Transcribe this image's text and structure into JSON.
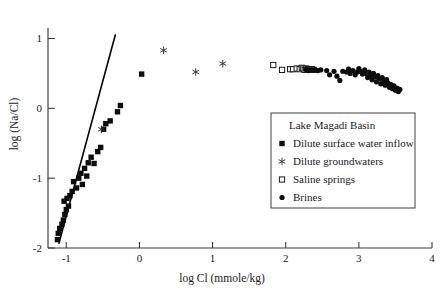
{
  "chart_data": {
    "type": "scatter",
    "title": "",
    "xlabel": "log Cl (mmole/kg)",
    "ylabel": "log (Na/Cl)",
    "xlim": [
      -1.25,
      4.0
    ],
    "ylim": [
      -2.0,
      1.15
    ],
    "xticks": [
      -1,
      0,
      1,
      2,
      3,
      4
    ],
    "xtick_labels": [
      "-1",
      "0",
      "1",
      "2",
      "3",
      "4"
    ],
    "yticks": [
      -2,
      -1,
      0,
      1
    ],
    "ytick_labels": [
      "-2",
      "-1",
      "0",
      "1"
    ],
    "grid": false,
    "legend_position": "center-right",
    "legend_title": "Lake Magadi Basin",
    "trend_line": {
      "name": "dilution trend",
      "x": [
        -1.1,
        -0.33
      ],
      "y": [
        -1.93,
        1.05
      ]
    },
    "series": [
      {
        "name": "Dilute surface water inflow",
        "marker": "filled-square",
        "color": "#0d0d0d",
        "points": [
          [
            -1.12,
            -1.88
          ],
          [
            -1.11,
            -1.79
          ],
          [
            -1.09,
            -1.72
          ],
          [
            -1.06,
            -1.66
          ],
          [
            -1.04,
            -1.6
          ],
          [
            -1.02,
            -1.52
          ],
          [
            -1.0,
            -1.45
          ],
          [
            -0.97,
            -1.4
          ],
          [
            -1.03,
            -1.33
          ],
          [
            -0.99,
            -1.29
          ],
          [
            -0.95,
            -1.25
          ],
          [
            -0.92,
            -1.19
          ],
          [
            -0.86,
            -1.14
          ],
          [
            -0.9,
            -1.05
          ],
          [
            -0.83,
            -1.0
          ],
          [
            -0.78,
            -1.09
          ],
          [
            -0.8,
            -0.93
          ],
          [
            -0.75,
            -0.86
          ],
          [
            -0.72,
            -0.97
          ],
          [
            -0.7,
            -0.78
          ],
          [
            -0.66,
            -0.7
          ],
          [
            -0.62,
            -0.79
          ],
          [
            -0.57,
            -0.62
          ],
          [
            -0.53,
            -0.56
          ],
          [
            -0.49,
            -0.3
          ],
          [
            -0.46,
            -0.22
          ],
          [
            -0.4,
            -0.18
          ],
          [
            -0.3,
            -0.05
          ],
          [
            -0.26,
            0.04
          ],
          [
            0.03,
            0.49
          ]
        ]
      },
      {
        "name": "Dilute  groundwaters",
        "marker": "asterisk",
        "color": "#2e2e2e",
        "points": [
          [
            -0.52,
            -0.3
          ],
          [
            0.33,
            0.83
          ],
          [
            0.77,
            0.52
          ],
          [
            1.14,
            0.64
          ]
        ]
      },
      {
        "name": "Saline springs",
        "marker": "open-square",
        "color": "#ffffff",
        "points": [
          [
            1.83,
            0.62
          ],
          [
            1.95,
            0.55
          ],
          [
            2.06,
            0.56
          ],
          [
            2.1,
            0.56
          ],
          [
            2.15,
            0.57
          ],
          [
            2.19,
            0.56
          ],
          [
            2.22,
            0.58
          ],
          [
            2.24,
            0.57
          ],
          [
            2.26,
            0.55
          ],
          [
            2.28,
            0.57
          ],
          [
            2.3,
            0.56
          ],
          [
            2.33,
            0.55
          ],
          [
            2.36,
            0.56
          ],
          [
            2.38,
            0.55
          ]
        ]
      },
      {
        "name": "Brines",
        "marker": "filled-circle",
        "color": "#0d0d0d",
        "points": [
          [
            2.28,
            0.56
          ],
          [
            2.31,
            0.54
          ],
          [
            2.35,
            0.55
          ],
          [
            2.4,
            0.55
          ],
          [
            2.44,
            0.54
          ],
          [
            2.48,
            0.55
          ],
          [
            2.56,
            0.54
          ],
          [
            2.6,
            0.48
          ],
          [
            2.66,
            0.53
          ],
          [
            2.7,
            0.46
          ],
          [
            2.74,
            0.4
          ],
          [
            2.78,
            0.53
          ],
          [
            2.83,
            0.52
          ],
          [
            2.86,
            0.56
          ],
          [
            2.88,
            0.5
          ],
          [
            2.92,
            0.54
          ],
          [
            2.95,
            0.48
          ],
          [
            2.98,
            0.52
          ],
          [
            3.0,
            0.57
          ],
          [
            3.02,
            0.53
          ],
          [
            3.05,
            0.49
          ],
          [
            3.08,
            0.55
          ],
          [
            3.1,
            0.5
          ],
          [
            3.12,
            0.44
          ],
          [
            3.14,
            0.52
          ],
          [
            3.16,
            0.47
          ],
          [
            3.18,
            0.41
          ],
          [
            3.2,
            0.5
          ],
          [
            3.22,
            0.45
          ],
          [
            3.24,
            0.38
          ],
          [
            3.26,
            0.47
          ],
          [
            3.28,
            0.42
          ],
          [
            3.3,
            0.35
          ],
          [
            3.32,
            0.44
          ],
          [
            3.34,
            0.39
          ],
          [
            3.36,
            0.33
          ],
          [
            3.38,
            0.41
          ],
          [
            3.4,
            0.36
          ],
          [
            3.42,
            0.3
          ],
          [
            3.44,
            0.34
          ],
          [
            3.46,
            0.28
          ],
          [
            3.48,
            0.32
          ],
          [
            3.5,
            0.26
          ],
          [
            3.52,
            0.29
          ],
          [
            3.54,
            0.24
          ],
          [
            3.56,
            0.27
          ]
        ]
      }
    ]
  },
  "legend": {
    "title": "Lake Magadi Basin",
    "entries": [
      {
        "label": "Dilute surface water inflow",
        "marker": "filled-square"
      },
      {
        "label": "Dilute  groundwaters",
        "marker": "asterisk"
      },
      {
        "label": "Saline springs",
        "marker": "open-square"
      },
      {
        "label": "Brines",
        "marker": "filled-circle"
      }
    ]
  }
}
